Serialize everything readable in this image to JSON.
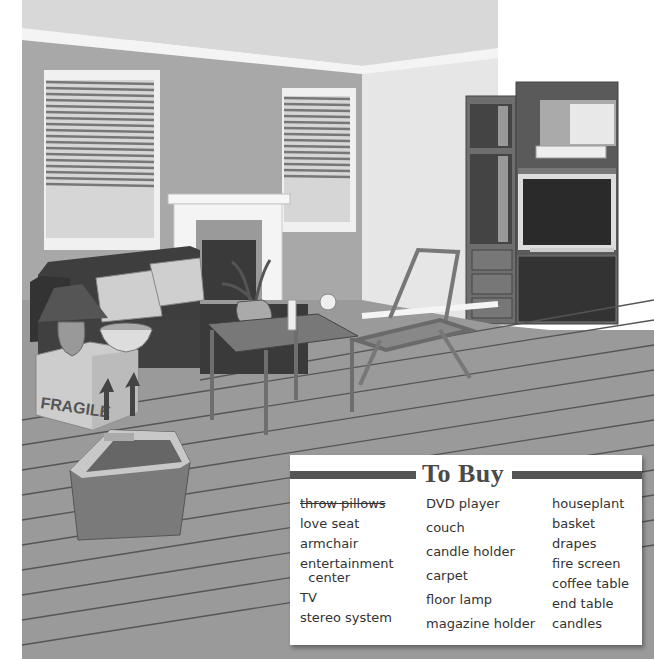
{
  "scene": {
    "description": "Illustrated living room with sofa, throw pillows, lamp, basket, moving boxes, coffee table, houseplant, candle holder, folding chair, fireplace, window blinds, and entertainment center with TV and DVD player",
    "box_label": "FRAGILE"
  },
  "todo_list": {
    "title": "To Buy",
    "columns": [
      {
        "items": [
          {
            "label": "throw pillows",
            "crossed_out": true
          },
          {
            "label": "love seat",
            "crossed_out": false
          },
          {
            "label": "armchair",
            "crossed_out": false
          },
          {
            "label": "entertainment\n  center",
            "crossed_out": false
          },
          {
            "label": "TV",
            "crossed_out": false
          },
          {
            "label": "stereo system",
            "crossed_out": false
          }
        ]
      },
      {
        "items": [
          {
            "label": "DVD player",
            "crossed_out": false
          },
          {
            "label": "couch",
            "crossed_out": false
          },
          {
            "label": "candle holder",
            "crossed_out": false
          },
          {
            "label": "carpet",
            "crossed_out": false
          },
          {
            "label": "floor lamp",
            "crossed_out": false
          },
          {
            "label": "magazine holder",
            "crossed_out": false
          }
        ]
      },
      {
        "items": [
          {
            "label": "houseplant",
            "crossed_out": false
          },
          {
            "label": "basket",
            "crossed_out": false
          },
          {
            "label": "drapes",
            "crossed_out": false
          },
          {
            "label": "fire screen",
            "crossed_out": false
          },
          {
            "label": "coffee table",
            "crossed_out": false
          },
          {
            "label": "end table",
            "crossed_out": false
          },
          {
            "label": "candles",
            "crossed_out": false
          }
        ]
      }
    ]
  }
}
